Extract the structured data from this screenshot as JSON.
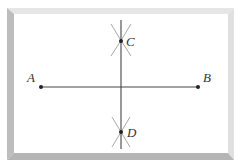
{
  "diagram": {
    "type": "perpendicular-bisector-construction",
    "segment": {
      "from": "A",
      "to": "B"
    },
    "bisector": {
      "through": [
        "C",
        "D"
      ]
    },
    "points": [
      {
        "id": "A",
        "label": "A",
        "x": 41,
        "y": 87
      },
      {
        "id": "B",
        "label": "B",
        "x": 198,
        "y": 87
      },
      {
        "id": "C",
        "label": "C",
        "x": 121,
        "y": 41
      },
      {
        "id": "D",
        "label": "D",
        "x": 121,
        "y": 132
      }
    ],
    "colors": {
      "line": "#444444",
      "arc": "#a8a8a8",
      "frame_dark": "#b8b8b8",
      "frame_light": "#e4e4e4",
      "label": "#333333"
    }
  }
}
